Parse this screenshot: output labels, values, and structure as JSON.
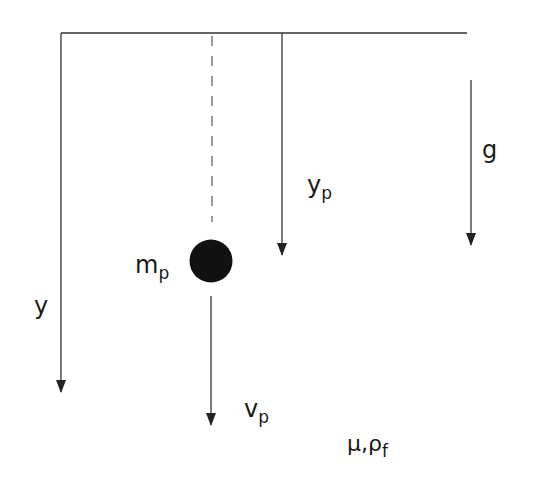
{
  "diagram": {
    "labels": {
      "y_axis": "y",
      "particle_position_main": "y",
      "particle_position_sub": "p",
      "gravity": "g",
      "mass_main": "m",
      "mass_sub": "p",
      "velocity_main": "v",
      "velocity_sub": "p",
      "fluid_main": "μ,ρ",
      "fluid_sub": "f"
    },
    "colors": {
      "stroke": "#333333",
      "particle": "#111111"
    }
  }
}
